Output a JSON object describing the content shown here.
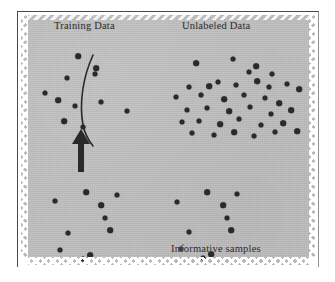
{
  "figure": {
    "background_color": "#ffffff",
    "panel_color": "#bdbdbd",
    "ink_color": "#2a2a2a",
    "labels": {
      "training": "Training Data",
      "unlabeled": "Unlabeled Data",
      "informative": "Informative samples"
    },
    "annotations": {
      "arrow_direction": "up",
      "boundary_shape": "curved decision boundary"
    }
  },
  "chart_data": {
    "type": "scatter",
    "title": "",
    "xlabel": "",
    "ylabel": "",
    "grid": false,
    "legend": "none",
    "axis_visible": false,
    "xlim": [
      0,
      295
    ],
    "ylim": [
      0,
      250
    ],
    "marker_color": "#2a2a2a",
    "marker_size": 5,
    "series": [
      {
        "name": "Training Data",
        "label": "Training Data",
        "count": 10,
        "points": [
          [
            57,
            41
          ],
          [
            46,
            63
          ],
          [
            24,
            78
          ],
          [
            37,
            85
          ],
          [
            54,
            91
          ],
          [
            80,
            87
          ],
          [
            43,
            106
          ],
          [
            62,
            112
          ],
          [
            106,
            96
          ],
          [
            75,
            53
          ],
          [
            74,
            59
          ]
        ]
      },
      {
        "name": "Unlabeled Data",
        "label": "Unlabeled Data",
        "count": 37,
        "points": [
          [
            175,
            48
          ],
          [
            212,
            44
          ],
          [
            228,
            57
          ],
          [
            235,
            51
          ],
          [
            251,
            59
          ],
          [
            168,
            72
          ],
          [
            188,
            71
          ],
          [
            197,
            67
          ],
          [
            215,
            70
          ],
          [
            236,
            66
          ],
          [
            248,
            72
          ],
          [
            266,
            69
          ],
          [
            278,
            74
          ],
          [
            155,
            82
          ],
          [
            180,
            80
          ],
          [
            203,
            84
          ],
          [
            223,
            80
          ],
          [
            244,
            83
          ],
          [
            258,
            88
          ],
          [
            166,
            95
          ],
          [
            186,
            93
          ],
          [
            208,
            96
          ],
          [
            229,
            92
          ],
          [
            250,
            99
          ],
          [
            270,
            95
          ],
          [
            161,
            107
          ],
          [
            178,
            106
          ],
          [
            199,
            109
          ],
          [
            218,
            104
          ],
          [
            240,
            110
          ],
          [
            262,
            108
          ],
          [
            171,
            118
          ],
          [
            193,
            120
          ],
          [
            213,
            117
          ],
          [
            233,
            121
          ],
          [
            254,
            117
          ],
          [
            276,
            116
          ]
        ]
      },
      {
        "name": "Informative samples (left)",
        "label": "",
        "count": 10,
        "points": [
          [
            65,
            177
          ],
          [
            96,
            180
          ],
          [
            34,
            186
          ],
          [
            80,
            190
          ],
          [
            84,
            203
          ],
          [
            47,
            218
          ],
          [
            89,
            215
          ],
          [
            39,
            235
          ],
          [
            62,
            244
          ],
          [
            69,
            240
          ]
        ]
      },
      {
        "name": "Informative samples (right)",
        "label": "Informative samples",
        "count": 10,
        "points": [
          [
            186,
            177
          ],
          [
            216,
            179
          ],
          [
            156,
            187
          ],
          [
            202,
            190
          ],
          [
            206,
            203
          ],
          [
            168,
            217
          ],
          [
            210,
            215
          ],
          [
            160,
            234
          ],
          [
            182,
            243
          ],
          [
            190,
            239
          ]
        ]
      }
    ]
  }
}
